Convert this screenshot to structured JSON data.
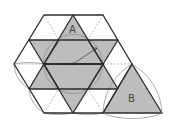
{
  "diagram": {
    "type": "geometry-figure",
    "labels": {
      "region_a": "A",
      "region_b": "B"
    },
    "colors": {
      "shade": "#bdbdbd",
      "stroke": "#2b2b2b",
      "thin": "#888888",
      "dashed": "#9a9a9a",
      "background": "#ffffff"
    }
  }
}
